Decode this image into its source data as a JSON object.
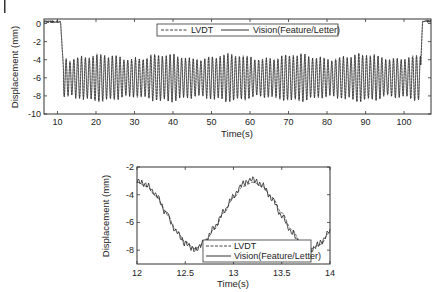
{
  "chart_data": [
    {
      "type": "line",
      "title": "",
      "xlabel": "Time(s)",
      "ylabel": "Displacement (mm)",
      "xlim": [
        6.5,
        107
      ],
      "ylim": [
        -10,
        0.5
      ],
      "xticks": [
        10,
        20,
        30,
        40,
        50,
        60,
        70,
        80,
        90,
        100
      ],
      "yticks": [
        0,
        -2,
        -4,
        -6,
        -8,
        -10
      ],
      "grid": false,
      "legend_position": "upper center",
      "series": [
        {
          "name": "LVDT",
          "style": "dashed",
          "description": "~0 mm until ~11 s, then oscillation between ~-3.5 and ~-8.5 mm (about 1 Hz) until ~104 s, then returns to ~0"
        },
        {
          "name": "Vision(Feature/Letter)",
          "style": "solid",
          "description": "tracks LVDT closely"
        }
      ],
      "x": [
        6.5,
        10.5,
        11.0,
        11.5,
        104.0,
        104.5,
        105.0,
        107.0
      ],
      "envelope_upper": [
        0.2,
        0.2,
        0.1,
        -3.3,
        -3.5,
        -3.0,
        0.3,
        0.3
      ],
      "envelope_lower": [
        0.0,
        0.0,
        -0.5,
        -8.5,
        -8.7,
        -4.0,
        0.0,
        0.0
      ]
    },
    {
      "type": "line",
      "title": "",
      "xlabel": "Time(s)",
      "ylabel": "Displacement (mm)",
      "xlim": [
        12,
        14
      ],
      "ylim": [
        -9,
        -2
      ],
      "xticks": [
        12,
        12.5,
        13,
        13.5,
        14
      ],
      "yticks": [
        -2,
        -4,
        -6,
        -8
      ],
      "grid": false,
      "legend_position": "lower center",
      "x": [
        12.0,
        12.1,
        12.2,
        12.3,
        12.4,
        12.5,
        12.6,
        12.7,
        12.8,
        12.9,
        13.0,
        13.1,
        13.2,
        13.3,
        13.4,
        13.5,
        13.6,
        13.7,
        13.8,
        13.9,
        14.0
      ],
      "series": [
        {
          "name": "LVDT",
          "style": "dashed",
          "values": [
            -3.1,
            -3.4,
            -4.1,
            -5.2,
            -6.5,
            -7.4,
            -7.9,
            -7.5,
            -6.5,
            -5.3,
            -4.2,
            -3.4,
            -3.1,
            -3.4,
            -4.2,
            -5.3,
            -6.5,
            -7.4,
            -7.9,
            -7.6,
            -6.7
          ]
        },
        {
          "name": "Vision(Feature/Letter)",
          "style": "solid",
          "values": [
            -3.0,
            -3.3,
            -4.0,
            -5.3,
            -6.6,
            -7.5,
            -8.0,
            -7.4,
            -6.4,
            -5.2,
            -4.1,
            -3.2,
            -2.9,
            -3.3,
            -4.3,
            -5.5,
            -6.7,
            -7.6,
            -8.0,
            -7.5,
            -6.6
          ]
        }
      ]
    }
  ],
  "top": {
    "ylabel": "Displacement (mm)",
    "xlabel": "Time(s)",
    "legend": [
      "LVDT",
      "Vision(Feature/Letter)"
    ],
    "xticks": [
      "10",
      "20",
      "30",
      "40",
      "50",
      "60",
      "70",
      "80",
      "90",
      "100"
    ],
    "yticks": [
      "0",
      "-2",
      "-4",
      "-6",
      "-8",
      "-10"
    ]
  },
  "bottom": {
    "ylabel": "Displacement (mm)",
    "xlabel": "Time(s)",
    "legend": [
      "LVDT",
      "Vision(Feature/Letter)"
    ],
    "xticks": [
      "12",
      "12.5",
      "13",
      "13.5",
      "14"
    ],
    "yticks": [
      "-2",
      "-4",
      "-6",
      "-8"
    ]
  }
}
